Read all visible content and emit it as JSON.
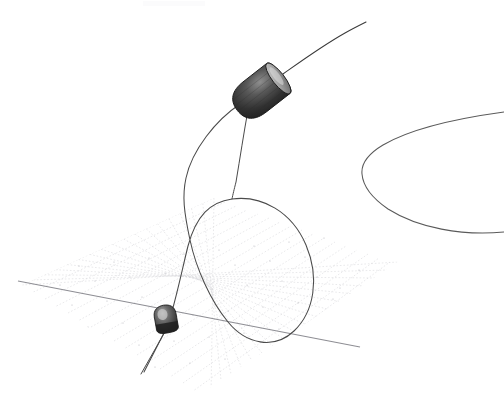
{
  "figure": {
    "background_color": "#ffffff",
    "width": 504,
    "height": 397,
    "caption": ""
  },
  "palette": {
    "background": "#ffffff",
    "trajectory_stroke": "#4a4a4a",
    "trajectory_stroke_dark": "#3a3a3a",
    "hyperbola_stroke": "#5a5a5a",
    "grid_line": "#d8d8dc",
    "grid_line_minor": "#e6e6ea",
    "grid_dot": "#b9b9c0",
    "axis_line": "#8e8e94",
    "cone_dark": "#2b2b2b",
    "cone_mid": "#4d4d4d",
    "cone_light": "#9a9a9a",
    "cone_cap_light": "#c9c9c9",
    "cone_outline": "#1c1c1c",
    "artifact": "#fbfbfc"
  },
  "chart_data": {
    "type": "line",
    "title": "",
    "xlabel": "",
    "ylabel": "",
    "grid": true,
    "legend_position": "none",
    "projection": "3d-perspective",
    "annotations": [],
    "series": [
      {
        "name": "incoming-outgoing-trajectory",
        "stroke": "#4a4a4a",
        "description": "Open trajectory entering from lower-left below the plane, rising through the lower body, looping once above the plane, then exiting to the upper right through the upper cone.",
        "path": "M 144,372 L 168,325 C 176,300 182,270 188,246 C 196,216 210,202 232,199 C 262,195 292,212 306,245 C 320,278 314,312 294,331 C 274,350 246,344 228,322 C 210,300 196,268 190,240 C 184,212 182,196 186,178 C 192,150 216,120 240,104 L 250,96"
      },
      {
        "name": "upper-exit-trajectory",
        "stroke": "#3a3a3a",
        "description": "Segment leaving the upper cone toward the top-right corner of the frame.",
        "path": "M 283,74 C 300,62 322,46 345,33 C 352,29 360,25 366,22"
      },
      {
        "name": "vertical-descent-segment",
        "stroke": "#4a4a4a",
        "description": "Nearly vertical segment descending from the upper cone base to the loop crossing point.",
        "path": "M 248,110 C 244,132 240,158 236,182 C 234,190 233,194 232,199"
      },
      {
        "name": "lower-body-tail",
        "stroke": "#4a4a4a",
        "description": "Short tail descending from the lower body toward the lower-left past the plane edge.",
        "path": "M 166,330 L 141,374"
      },
      {
        "name": "hyperbolic-arc-right",
        "stroke": "#5a5a5a",
        "description": "Separate hyperbola-like arc opening to the right, vertex near x=362.",
        "path": "M 504,112 C 460,118 412,128 383,145 C 368,154 361,164 362,174 C 363,186 372,198 388,209 C 418,228 462,236 504,232"
      }
    ],
    "plane": {
      "name": "perspective-mesh-plane",
      "corners": [
        {
          "label": "left",
          "x": 22,
          "y": 285
        },
        {
          "label": "top",
          "x": 214,
          "y": 198
        },
        {
          "label": "right",
          "x": 398,
          "y": 262
        },
        {
          "label": "bottom",
          "x": 196,
          "y": 397
        }
      ],
      "grid_divisions_u": 17,
      "grid_divisions_v": 15,
      "style": "dotted"
    },
    "axis_line": {
      "name": "ground-axis-line",
      "description": "Darker straight axis line crossing the plane from left edge to lower right.",
      "x1": 18,
      "y1": 281,
      "x2": 360,
      "y2": 347
    },
    "bodies": [
      {
        "name": "upper-cone",
        "label": "",
        "center_x": 261,
        "center_y": 92,
        "length": 56,
        "radius": 19,
        "tilt_degrees": -38,
        "shading": "dark with lighter elliptical cap at upper-right"
      },
      {
        "name": "lower-body",
        "label": "",
        "center_x": 166,
        "center_y": 320,
        "length": 22,
        "radius": 11,
        "tilt_degrees": -10,
        "shading": "dark with light highlight at upper-left"
      }
    ]
  }
}
